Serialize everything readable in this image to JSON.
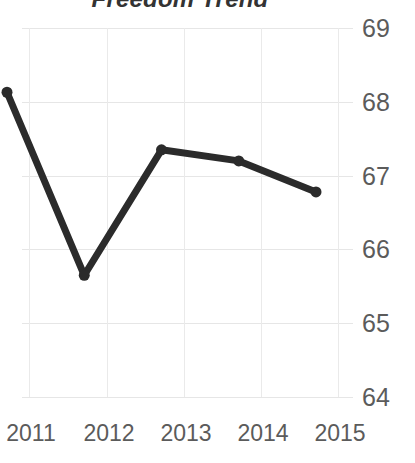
{
  "chart_data": {
    "type": "line",
    "title": "Freedom Trend",
    "xlabel": "",
    "ylabel": "",
    "categories": [
      "2011",
      "2012",
      "2013",
      "2014",
      "2015"
    ],
    "x": [
      2011,
      2012,
      2013,
      2014,
      2015
    ],
    "values": [
      67.75,
      65.27,
      66.97,
      66.82,
      66.4
    ],
    "series": [
      {
        "name": "Freedom Score",
        "values": [
          67.75,
          65.27,
          66.97,
          66.82,
          66.4
        ]
      }
    ],
    "ylim": [
      64,
      69
    ],
    "yticks": [
      69,
      68,
      67,
      66,
      65,
      64
    ],
    "ytick_labels": [
      "69",
      "68",
      "67",
      "66",
      "65",
      "64"
    ],
    "xtick_labels": [
      "2011",
      "2012",
      "2013",
      "2014",
      "2015"
    ],
    "grid": true,
    "grid_axis": "both",
    "legend": false,
    "legend_position": "none",
    "y_axis_position": "right",
    "markers": true,
    "line_color": "#2b2b2b",
    "marker_color": "#2b2b2b",
    "grid_color": "#e6e6e6",
    "tick_label_color": "#5b5b5b",
    "title_color": "#333333",
    "background_color": "#ffffff",
    "line_width": 7,
    "marker_size": 11
  }
}
